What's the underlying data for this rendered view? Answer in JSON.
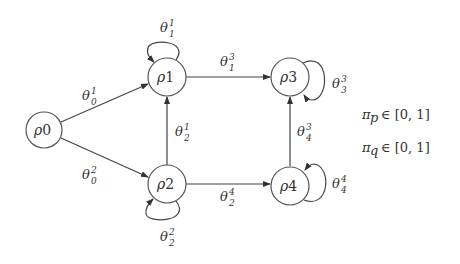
{
  "nodes": [
    {
      "id": "rho0",
      "base": "ρ",
      "sub": "0"
    },
    {
      "id": "rho1",
      "base": "ρ",
      "sub": "1"
    },
    {
      "id": "rho2",
      "base": "ρ",
      "sub": "2"
    },
    {
      "id": "rho3",
      "base": "ρ",
      "sub": "3"
    },
    {
      "id": "rho4",
      "base": "ρ",
      "sub": "4"
    }
  ],
  "edges": [
    {
      "from": "rho0",
      "to": "rho1",
      "base": "θ",
      "sub": "0",
      "sup": "1"
    },
    {
      "from": "rho0",
      "to": "rho2",
      "base": "θ",
      "sub": "0",
      "sup": "2"
    },
    {
      "from": "rho1",
      "to": "rho1",
      "base": "θ",
      "sub": "1",
      "sup": "1"
    },
    {
      "from": "rho1",
      "to": "rho3",
      "base": "θ",
      "sub": "1",
      "sup": "3"
    },
    {
      "from": "rho2",
      "to": "rho1",
      "base": "θ",
      "sub": "2",
      "sup": "1"
    },
    {
      "from": "rho2",
      "to": "rho2",
      "base": "θ",
      "sub": "2",
      "sup": "2"
    },
    {
      "from": "rho2",
      "to": "rho4",
      "base": "θ",
      "sub": "2",
      "sup": "4"
    },
    {
      "from": "rho3",
      "to": "rho3",
      "base": "θ",
      "sub": "3",
      "sup": "3"
    },
    {
      "from": "rho4",
      "to": "rho3",
      "base": "θ",
      "sub": "4",
      "sup": "3"
    },
    {
      "from": "rho4",
      "to": "rho4",
      "base": "θ",
      "sub": "4",
      "sup": "4"
    }
  ],
  "constraints": [
    {
      "base": "π",
      "sub": "p",
      "text": "∈ [0, 1]"
    },
    {
      "base": "π",
      "sub": "q",
      "text": "∈ [0, 1]"
    }
  ]
}
